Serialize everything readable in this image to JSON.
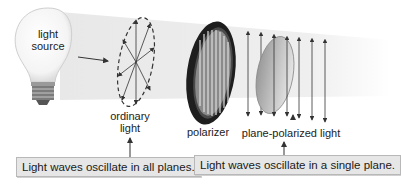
{
  "labels": {
    "light_source": "light\nsource",
    "light_source_line1": "light",
    "light_source_line2": "source",
    "ordinary_light_line1": "ordinary",
    "ordinary_light_line2": "light",
    "polarizer": "polarizer",
    "plane_polarized_light": "plane-polarized light"
  },
  "captions": {
    "all_planes": "Light waves oscillate in all planes.",
    "single_plane": "Light waves oscillate in a single plane."
  },
  "colors": {
    "beam": "#ececec",
    "polarizer_ring": "#2a2a2a",
    "caption_bg": "#e6e6e6",
    "arrow": "#333333"
  }
}
